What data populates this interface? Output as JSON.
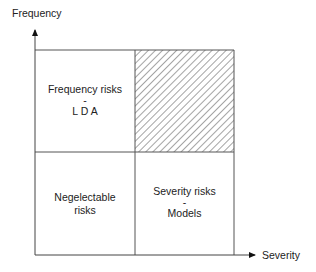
{
  "axes": {
    "y_label": "Frequency",
    "x_label": "Severity"
  },
  "quadrants": {
    "top_left": {
      "line1": "Frequency risks",
      "line2": "-",
      "line3": "L D A"
    },
    "top_right": {
      "pattern": "hatched"
    },
    "bottom_left": {
      "line1": "Negelectable",
      "line2": "risks"
    },
    "bottom_right": {
      "line1": "Severity risks",
      "line2": "-",
      "line3": "Models"
    }
  },
  "colors": {
    "line": "#555555",
    "hatch": "#666666",
    "text": "#222222"
  }
}
